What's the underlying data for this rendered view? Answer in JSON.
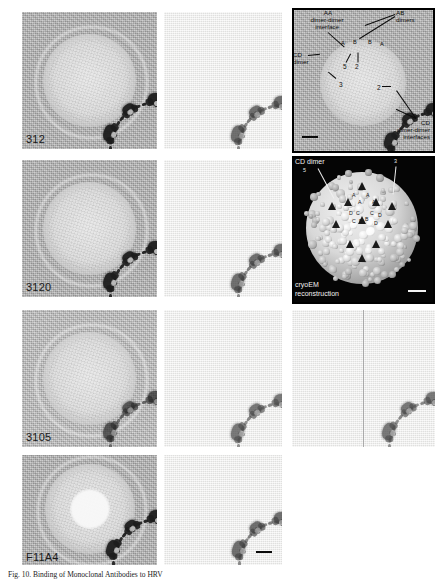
{
  "figure": {
    "rows": [
      {
        "label": "312"
      },
      {
        "label": "3120"
      },
      {
        "label": "3105"
      },
      {
        "label": "F11A4"
      }
    ],
    "columns": [
      {
        "name": "central-section"
      },
      {
        "name": "difference-map"
      },
      {
        "name": "annotated-section"
      }
    ]
  },
  "annotated_panel": {
    "name": "annotated-central-section",
    "labels": {
      "aa_interface": "AA\ndimer-dimer\ninterface",
      "aa_interface_line1": "AA",
      "aa_interface_line2": "dimer-dimer",
      "aa_interface_line3": "interface",
      "ab_dimers_line1": "AB",
      "ab_dimers_line2": "dimers",
      "cd_dimer_line1": "CD",
      "cd_dimer_line2": "dimer",
      "cd_interfaces_line1": "CD",
      "cd_interfaces_line2": "dimer-dimer",
      "cd_interfaces_line3": "interfaces"
    },
    "subunits": [
      "A",
      "B",
      "B",
      "A"
    ],
    "symmetry_axes": [
      "5",
      "2",
      "3",
      "2"
    ]
  },
  "cryoem_panel": {
    "name": "cryoem-reconstruction",
    "title_line1": "cryoEM",
    "title_line2": "reconstruction",
    "cd_dimer_label": "CD dimer",
    "axis_five": "5",
    "axis_three": "3",
    "subunit_labels": [
      "A",
      "A",
      "A",
      "A",
      "D",
      "C",
      "C",
      "D",
      "C",
      "B",
      "B",
      "D"
    ]
  },
  "caption": {
    "prefix": "Fig. 10.",
    "text": "Fig. 10.  Binding of Mono­clonal Antibodies to HRV"
  },
  "colors": {
    "section_background": "#bdbdbd",
    "difference_background": "#f0f0ee",
    "density": "#1e1e1e",
    "panel_border": "#000000",
    "cryoem_background": "#050505",
    "cryoem_surface": "#dcdcdc"
  }
}
